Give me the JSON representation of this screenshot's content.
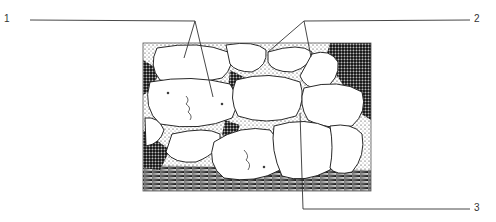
{
  "figure": {
    "type": "histology-line-drawing",
    "colors": {
      "background": "#ffffff",
      "ink": "#111111",
      "leader_line": "#333333",
      "cell_fill": "#ffffff"
    }
  },
  "labels": [
    {
      "id": "1",
      "text": "1",
      "side": "left",
      "targets": 2
    },
    {
      "id": "2",
      "text": "2",
      "side": "right",
      "targets": 2
    },
    {
      "id": "3",
      "text": "3",
      "side": "right",
      "targets": 1
    }
  ]
}
